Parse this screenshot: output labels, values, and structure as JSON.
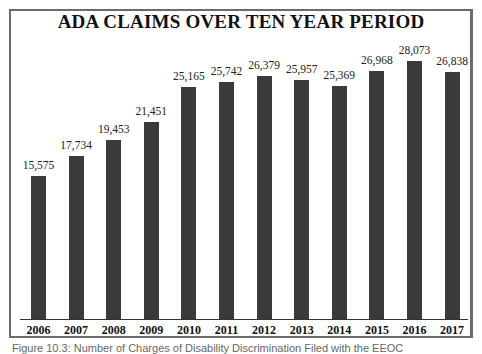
{
  "chart_data": {
    "type": "bar",
    "title": "ADA CLAIMS OVER TEN YEAR PERIOD",
    "categories": [
      "2006",
      "2007",
      "2008",
      "2009",
      "2010",
      "2011",
      "2012",
      "2013",
      "2014",
      "2015",
      "2016",
      "2017"
    ],
    "values": [
      15575,
      17734,
      19453,
      21451,
      25165,
      25742,
      26379,
      25957,
      25369,
      26968,
      28073,
      26838
    ],
    "value_labels": [
      "15,575",
      "17,734",
      "19,453",
      "21,451",
      "25,165",
      "25,742",
      "26,379",
      "25,957",
      "25,369",
      "26,968",
      "28,073",
      "26,838"
    ],
    "xlabel": "",
    "ylabel": "",
    "ylim": [
      0,
      30000
    ],
    "grid": false,
    "legend": null,
    "bar_color": "#3a3a3a"
  },
  "caption": "Figure 10.3: Number of Charges of Disability Discrimination Filed with the EEOC"
}
